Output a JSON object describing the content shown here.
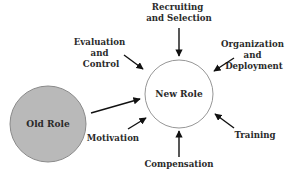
{
  "diagram": {
    "type": "role-transition",
    "colors": {
      "old_role_fill": "#b9b9b9",
      "old_role_stroke": "#8a8a8a",
      "new_role_fill": "#ffffff",
      "new_role_stroke": "#8a8a8a",
      "arrow": "#111111",
      "text": "#2a2a2a"
    },
    "nodes": {
      "old_role": {
        "label": "Old Role"
      },
      "new_role": {
        "label": "New Role"
      }
    },
    "factors": [
      {
        "id": "recruiting",
        "lines": [
          "Recruiting",
          "and Selection"
        ]
      },
      {
        "id": "organization",
        "lines": [
          "Organization",
          "and",
          "Deployment"
        ]
      },
      {
        "id": "training",
        "lines": [
          "Training"
        ]
      },
      {
        "id": "compensation",
        "lines": [
          "Compensation"
        ]
      },
      {
        "id": "motivation",
        "lines": [
          "Motivation"
        ]
      },
      {
        "id": "evaluation",
        "lines": [
          "Evaluation",
          "and",
          "Control"
        ]
      }
    ]
  }
}
